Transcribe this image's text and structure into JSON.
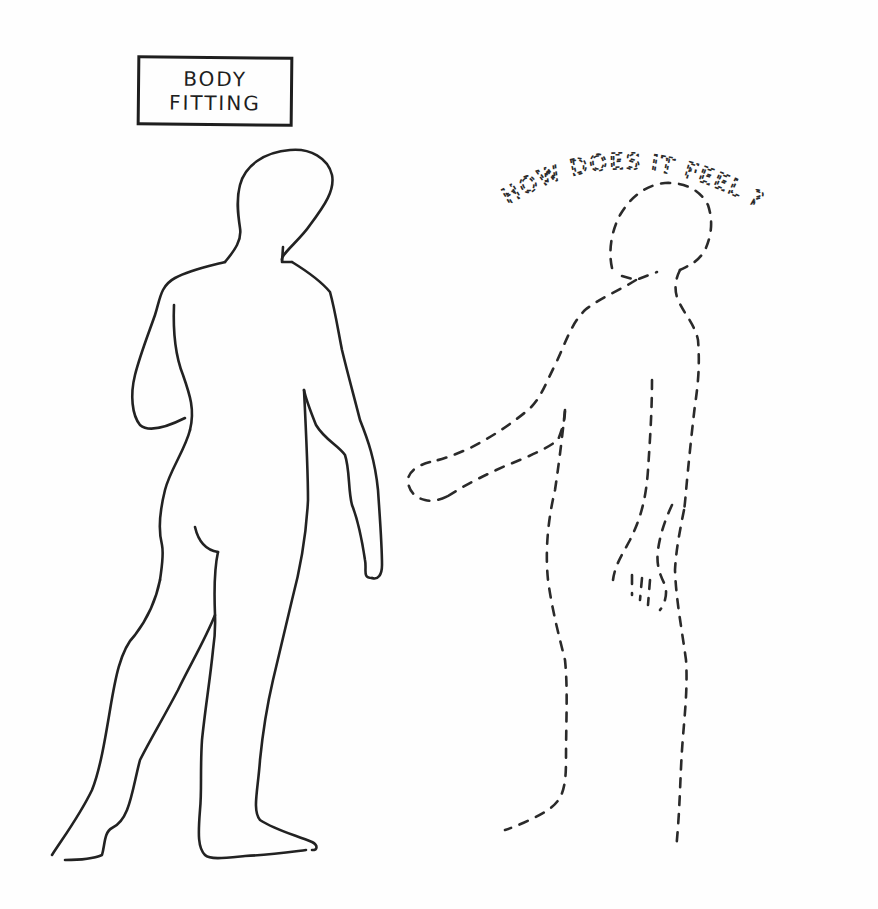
{
  "illustration": {
    "title_box": {
      "line1": "BODY",
      "line2": "FITTING"
    },
    "caption_arc": "HOW DOES IT FEEL ?",
    "figures": [
      {
        "name": "solid-figure",
        "style": "solid outline",
        "description": "standing person seen from behind"
      },
      {
        "name": "dashed-figure",
        "style": "dashed outline",
        "description": "imagined body, arm reaching outward"
      }
    ],
    "colors": {
      "ink": "#222222",
      "paper": "#fefefe"
    }
  }
}
